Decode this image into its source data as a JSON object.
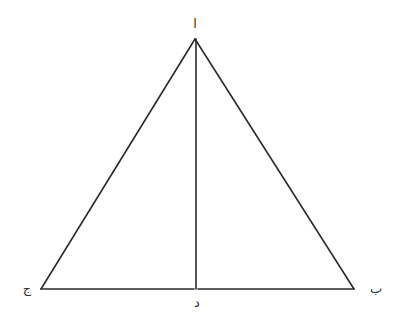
{
  "diagram": {
    "type": "geometry",
    "line_color": "#2b2b2b",
    "label_color": "#333333",
    "points": {
      "apex": {
        "label": "ا"
      },
      "right": {
        "label": "ب"
      },
      "left": {
        "label": "ج"
      },
      "foot": {
        "label": "د"
      }
    },
    "segments": [
      {
        "from": "apex",
        "to": "left"
      },
      {
        "from": "apex",
        "to": "right"
      },
      {
        "from": "left",
        "to": "right"
      },
      {
        "from": "apex",
        "to": "foot"
      }
    ]
  }
}
